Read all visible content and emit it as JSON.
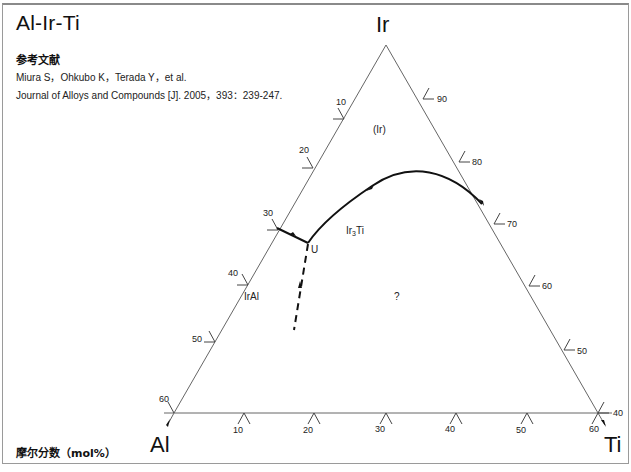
{
  "title": "Al-Ir-Ti",
  "reference": {
    "heading": "参考文献",
    "authors": "Miura S，Ohkubo K，Terada Y，et al.",
    "citation": "Journal of Alloys and Compounds [J]. 2005，393：239-247."
  },
  "footer": "摩尔分数（mol%）",
  "diagram": {
    "type": "ternary-liquidus-projection",
    "corners": {
      "top": "Ir",
      "left": "Al",
      "right": "Ti"
    },
    "left_axis_ticks": [
      "10",
      "20",
      "30",
      "40",
      "50",
      "60"
    ],
    "right_axis_ticks": [
      "90",
      "80",
      "70",
      "60",
      "50",
      "40"
    ],
    "bottom_axis_ticks": [
      "10",
      "20",
      "30",
      "40",
      "50",
      "60"
    ],
    "phase_labels": {
      "ir": "(Ir)",
      "ir3ti_base": "Ir",
      "ir3ti_sub": "3",
      "ir3ti_tail": "Ti",
      "iral": "IrAl",
      "unknown": "?",
      "invariant_point": "U"
    }
  }
}
